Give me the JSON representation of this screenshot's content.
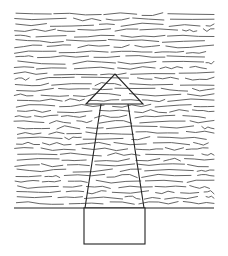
{
  "figure": {
    "colors": {
      "background": "#ffffff",
      "strokes": "#555555",
      "outline": "#222222"
    },
    "field": {
      "x0": 14,
      "x1": 214,
      "y0": 14,
      "y1": 208,
      "row_spacing": 5.4
    },
    "baseline": {
      "x0": 14,
      "x1": 214,
      "y": 208
    },
    "arrow": {
      "tip": [
        115,
        74
      ],
      "head_left": [
        86,
        104
      ],
      "head_right": [
        143,
        104
      ],
      "shaft_top_left": [
        101,
        104
      ],
      "shaft_top_right": [
        128,
        104
      ],
      "shaft_bottom_left": [
        85,
        208
      ],
      "shaft_bottom_right": [
        144,
        208
      ]
    },
    "box": {
      "x": 84,
      "y": 208,
      "width": 61,
      "height": 36
    }
  }
}
